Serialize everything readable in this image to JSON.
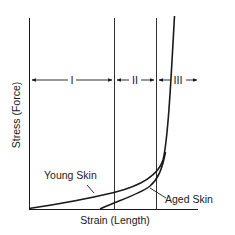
{
  "diagram": {
    "type": "stress-strain curve",
    "axes": {
      "x_label": "Strain (Length)",
      "y_label": "Stress (Force)"
    },
    "regions": [
      {
        "label": "I"
      },
      {
        "label": "II"
      },
      {
        "label": "III"
      }
    ],
    "curves": [
      {
        "name": "Young Skin",
        "label": "Young Skin"
      },
      {
        "name": "Aged Skin",
        "label": "Aged Skin"
      }
    ],
    "colors": {
      "line": "#1a1a1a",
      "background": "#ffffff"
    }
  }
}
